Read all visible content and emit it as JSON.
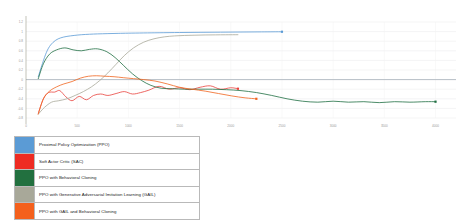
{
  "chart_data": {
    "type": "line",
    "title": "",
    "xlabel": "",
    "ylabel": "",
    "grid": true,
    "legend_position": "below",
    "xlim": [
      0,
      4200
    ],
    "ylim": [
      -0.8,
      1.2
    ],
    "yticks": [
      1.2,
      1,
      0.8,
      0.6,
      0.4,
      0.2,
      0,
      -0.2,
      -0.4,
      -0.6,
      -0.8
    ],
    "ytick_labels": [
      "1.2",
      "1",
      "0.8",
      "0.6",
      "0.4",
      "0.2",
      "0",
      "-0.2",
      "-0.4",
      "-0.6",
      "-0.8"
    ],
    "xticks": [
      0,
      500,
      1000,
      1500,
      2000,
      2500,
      3000,
      3500,
      4000
    ],
    "xtick_labels": [
      "0",
      "500",
      "1000",
      "1500",
      "2000",
      "2500",
      "3000",
      "3500",
      "4000"
    ],
    "series": [
      {
        "name": "Proximal Policy Optimization (PPO)",
        "color": "#5b9bd5",
        "end_marker": true,
        "x": [
          120,
          160,
          200,
          240,
          290,
          340,
          400,
          470,
          540,
          620,
          700,
          800,
          900,
          1000,
          1150,
          1300,
          1500,
          1700,
          1900,
          2100,
          2300,
          2500
        ],
        "y": [
          0.06,
          0.33,
          0.57,
          0.72,
          0.82,
          0.87,
          0.9,
          0.92,
          0.935,
          0.945,
          0.952,
          0.958,
          0.963,
          0.967,
          0.972,
          0.976,
          0.981,
          0.985,
          0.988,
          0.991,
          0.994,
          0.997
        ]
      },
      {
        "name": "Soft Actor Critic (SAC)",
        "color": "#e8413c",
        "end_marker": true,
        "x": [
          120,
          170,
          220,
          280,
          330,
          390,
          450,
          520,
          590,
          660,
          730,
          800,
          880,
          960,
          1040,
          1120,
          1200,
          1300,
          1400,
          1500,
          1600,
          1700,
          1800,
          1900,
          2000,
          2070
        ],
        "y": [
          -0.7,
          -0.4,
          -0.27,
          -0.26,
          -0.23,
          -0.36,
          -0.44,
          -0.35,
          -0.42,
          -0.33,
          -0.3,
          -0.33,
          -0.29,
          -0.25,
          -0.3,
          -0.27,
          -0.22,
          -0.14,
          -0.2,
          -0.17,
          -0.21,
          -0.16,
          -0.13,
          -0.2,
          -0.17,
          -0.19
        ]
      },
      {
        "name": "PPO with Behavioral Cloning",
        "color": "#1f6f43",
        "end_marker": true,
        "x": [
          120,
          170,
          230,
          300,
          380,
          460,
          540,
          620,
          700,
          790,
          870,
          950,
          1040,
          1130,
          1220,
          1320,
          1430,
          1550,
          1680,
          1820,
          1960,
          2100,
          2250,
          2400,
          2550,
          2700,
          2850,
          3000,
          3150,
          3300,
          3450,
          3600,
          3750,
          3900,
          4000
        ],
        "y": [
          0.02,
          0.33,
          0.53,
          0.62,
          0.66,
          0.62,
          0.6,
          0.63,
          0.64,
          0.58,
          0.46,
          0.3,
          0.12,
          -0.02,
          -0.12,
          -0.18,
          -0.19,
          -0.2,
          -0.2,
          -0.2,
          -0.21,
          -0.23,
          -0.27,
          -0.33,
          -0.4,
          -0.45,
          -0.47,
          -0.45,
          -0.47,
          -0.46,
          -0.48,
          -0.46,
          -0.47,
          -0.46,
          -0.46
        ]
      },
      {
        "name": "PPO with Generative Adversarial Imitation Learning (GAIL)",
        "color": "#a8a899",
        "end_marker": false,
        "x": [
          120,
          180,
          250,
          320,
          400,
          480,
          560,
          640,
          720,
          800,
          880,
          960,
          1050,
          1150,
          1250,
          1350,
          1450,
          1550,
          1650,
          1750,
          1850,
          1950,
          2070
        ],
        "y": [
          -0.72,
          -0.58,
          -0.47,
          -0.44,
          -0.4,
          -0.33,
          -0.25,
          -0.15,
          -0.02,
          0.14,
          0.32,
          0.5,
          0.66,
          0.78,
          0.85,
          0.89,
          0.91,
          0.92,
          0.925,
          0.93,
          0.932,
          0.934,
          0.935
        ]
      },
      {
        "name": "PPO with GAIL and Behavioral Cloning",
        "color": "#f0641e",
        "end_marker": true,
        "x": [
          120,
          170,
          230,
          300,
          370,
          450,
          530,
          610,
          690,
          770,
          860,
          950,
          1050,
          1150,
          1260,
          1380,
          1500,
          1620,
          1750,
          1880,
          2010,
          2140,
          2250
        ],
        "y": [
          -0.72,
          -0.4,
          -0.24,
          -0.15,
          -0.09,
          -0.04,
          0.03,
          0.07,
          0.08,
          0.07,
          0.06,
          0.04,
          0.02,
          0.0,
          -0.03,
          -0.09,
          -0.16,
          -0.2,
          -0.24,
          -0.29,
          -0.34,
          -0.38,
          -0.4
        ]
      }
    ]
  },
  "legend": {
    "rows": [
      {
        "label": "Proximal Policy Optimization (PPO)",
        "color": "#5b9bd5"
      },
      {
        "label": "Soft Actor Critic (SAC)",
        "color": "#ee2b22"
      },
      {
        "label": "PPO with Behavioral Cloning",
        "color": "#22703f"
      },
      {
        "label": "PPO with Generative Adversarial Imitation Learning (GAIL)",
        "color": "#a8a899"
      },
      {
        "label": "PPO with GAIL and Behavioral Cloning",
        "color": "#f4601c"
      }
    ]
  }
}
